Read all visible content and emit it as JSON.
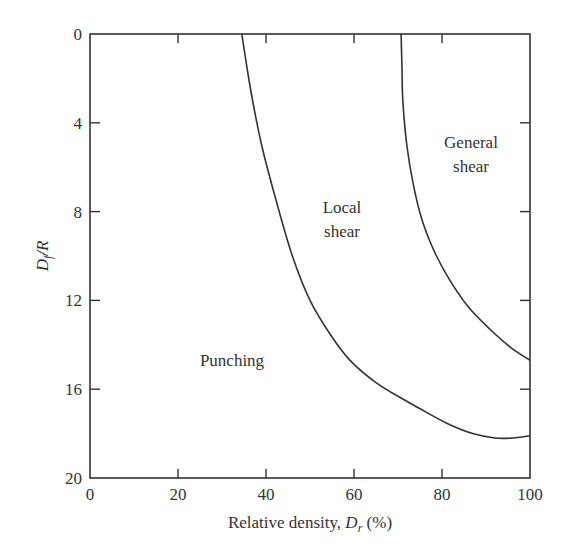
{
  "chart_data": {
    "type": "line",
    "title": "",
    "xlabel": "Relative density, D_r (%)",
    "ylabel": "D_f/R",
    "xlim": [
      0,
      100
    ],
    "ylim": [
      0,
      20
    ],
    "y_inverted": true,
    "grid": false,
    "legend": "none",
    "x_ticks": [
      0,
      20,
      40,
      60,
      80,
      100
    ],
    "y_ticks": [
      0,
      4,
      8,
      12,
      16,
      20
    ],
    "series": [
      {
        "name": "Punching / Local shear boundary",
        "x": [
          34.5,
          36.5,
          39,
          42.3,
          46,
          50,
          54.5,
          59.1,
          65,
          71.6,
          77,
          81.8,
          87,
          92,
          96,
          100
        ],
        "y": [
          0,
          2.5,
          5,
          7.5,
          10,
          12,
          13.5,
          14.7,
          15.7,
          16.5,
          17.1,
          17.6,
          18.0,
          18.2,
          18.2,
          18.1
        ]
      },
      {
        "name": "Local shear / General shear boundary",
        "x": [
          70.7,
          70.9,
          71.1,
          72,
          73.5,
          75.5,
          78.5,
          81.8,
          86,
          90.9,
          95.5,
          100
        ],
        "y": [
          0,
          1.5,
          3,
          5,
          6.8,
          8.4,
          9.9,
          11.1,
          12.3,
          13.3,
          14.1,
          14.7
        ]
      }
    ],
    "annotations": [
      {
        "text": "Punching",
        "x": 26,
        "y": 14.6
      },
      {
        "text": "Local shear",
        "x": 57,
        "y": 8
      },
      {
        "text": "General shear",
        "x": 87,
        "y": 5
      }
    ]
  },
  "axes": {
    "x_label_main": "Relative density, ",
    "x_label_var": "D",
    "x_label_sub": "r",
    "x_label_unit": " (%)",
    "y_label_var": "D",
    "y_label_sub": "f",
    "y_label_rest": "/R",
    "x_tick_labels": [
      "0",
      "20",
      "40",
      "60",
      "80",
      "100"
    ],
    "y_tick_labels": [
      "0",
      "4",
      "8",
      "12",
      "16",
      "20"
    ]
  },
  "regions": {
    "punching": "Punching",
    "local_line1": "Local",
    "local_line2": "shear",
    "general_line1": "General",
    "general_line2": "shear"
  }
}
